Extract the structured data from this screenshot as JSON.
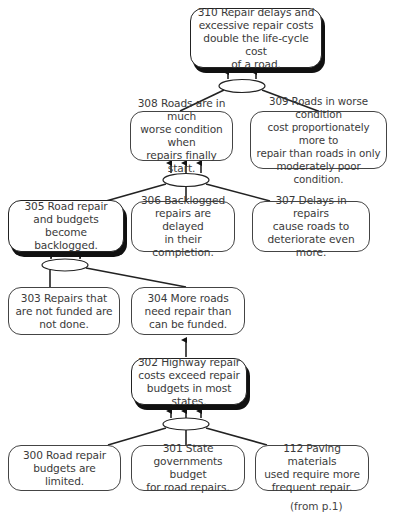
{
  "diagram": {
    "type": "current-reality-tree",
    "nodes": [
      {
        "id": "310",
        "text": "310 Repair delays and\nexcessive repair costs\ndouble the life-cycle cost\nof a road.",
        "emphasis": true
      },
      {
        "id": "308",
        "text": "308 Roads are in much\nworse condition when\nrepairs finally start.",
        "emphasis": false
      },
      {
        "id": "309",
        "text": "309 Roads in worse condition\ncost proportionately more to\nrepair than roads in only\nmoderately poor condition.",
        "emphasis": false
      },
      {
        "id": "305",
        "text": "305 Road repair\nand budgets become\nbacklogged.",
        "emphasis": true
      },
      {
        "id": "306",
        "text": "306 Backlogged\nrepairs are delayed\nin their completion.",
        "emphasis": false
      },
      {
        "id": "307",
        "text": "307 Delays in repairs\ncause roads to\ndeteriorate even more.",
        "emphasis": false
      },
      {
        "id": "303",
        "text": "303 Repairs that\nare not funded are\nnot done.",
        "emphasis": false
      },
      {
        "id": "304",
        "text": "304 More roads\nneed repair than\ncan be funded.",
        "emphasis": false
      },
      {
        "id": "302",
        "text": "302 Highway repair\ncosts exceed repair\nbudgets in most states.",
        "emphasis": true
      },
      {
        "id": "300",
        "text": "300 Road repair\nbudgets are limited.",
        "emphasis": false
      },
      {
        "id": "301",
        "text": "301 State\ngovernments budget\nfor road repairs.",
        "emphasis": false
      },
      {
        "id": "112",
        "text": "112 Paving materials\nused require more\nfrequent repair.",
        "emphasis": false
      }
    ],
    "edges": [
      {
        "from": [
          "308",
          "309"
        ],
        "to": "310",
        "type": "and"
      },
      {
        "from": [
          "305",
          "306",
          "307"
        ],
        "to": "308",
        "type": "and"
      },
      {
        "from": [
          "303",
          "304"
        ],
        "to": "305",
        "type": "and"
      },
      {
        "from": [
          "302"
        ],
        "to": "304",
        "type": "single"
      },
      {
        "from": [
          "300",
          "301",
          "112"
        ],
        "to": "302",
        "type": "and"
      }
    ],
    "footnote": "(from p.1)"
  }
}
